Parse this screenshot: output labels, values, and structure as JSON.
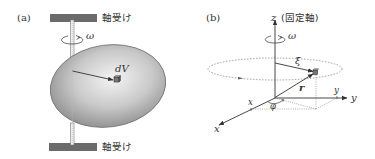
{
  "panel_a": {
    "label": "(a)",
    "top_bearing_label": "軸受け",
    "bottom_bearing_label": "軸受け",
    "omega_label": "ω",
    "volume_element_label": "dV"
  },
  "panel_b": {
    "label": "(b)",
    "z_axis_label": "z",
    "z_axis_note": "(固定軸)",
    "omega_label": "ω",
    "xi_label": "ξ",
    "r_label": "r",
    "x_axis_label": "x",
    "y_axis_label": "y",
    "x_component_label": "x",
    "y_component_label": "y",
    "phi_label": "φ"
  },
  "colors": {
    "line": "#333333",
    "bearing": "#6b6b6b",
    "body_dark": "#8c8c8c",
    "body_light": "#f2f2f2",
    "dashed": "#777777"
  }
}
